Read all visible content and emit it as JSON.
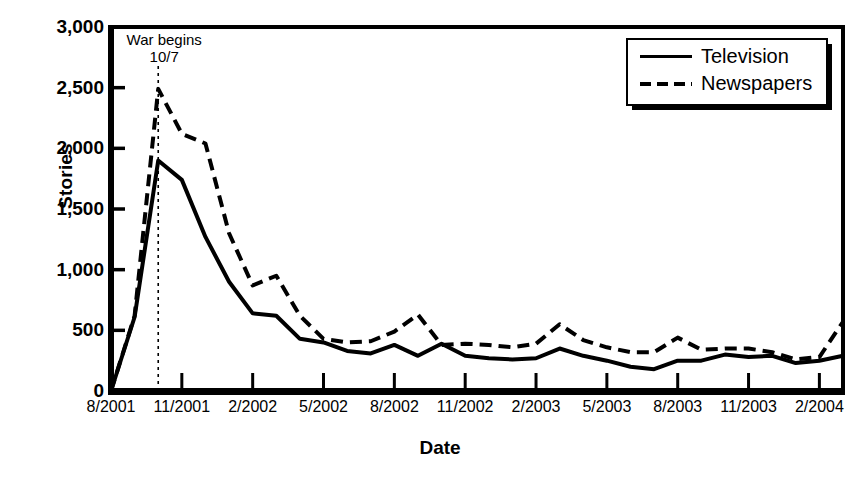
{
  "chart_data": {
    "type": "line",
    "title": "",
    "xlabel": "Date",
    "ylabel": "Stories",
    "ylim": [
      0,
      3000
    ],
    "ytick_values": [
      0,
      500,
      1000,
      1500,
      2000,
      2500,
      3000
    ],
    "ytick_labels": [
      "0",
      "500",
      "1,000",
      "1,500",
      "2,000",
      "2,500",
      "3,000"
    ],
    "xtick_labels": [
      "8/2001",
      "11/2001",
      "2/2002",
      "5/2002",
      "8/2002",
      "11/2002",
      "2/2003",
      "5/2003",
      "8/2003",
      "11/2003",
      "2/2004"
    ],
    "grid": false,
    "legend_position": "top-right",
    "x": [
      "8/2001",
      "9/2001",
      "10/2001",
      "11/2001",
      "12/2001",
      "1/2002",
      "2/2002",
      "3/2002",
      "4/2002",
      "5/2002",
      "6/2002",
      "7/2002",
      "8/2002",
      "9/2002",
      "10/2002",
      "11/2002",
      "12/2002",
      "1/2003",
      "2/2003",
      "3/2003",
      "4/2003",
      "5/2003",
      "6/2003",
      "7/2003",
      "8/2003",
      "9/2003",
      "10/2003",
      "11/2003",
      "12/2003",
      "1/2004",
      "2/2004",
      "3/2004"
    ],
    "series": [
      {
        "name": "Television",
        "style": "solid",
        "values": [
          0,
          610,
          1900,
          1740,
          1270,
          900,
          640,
          620,
          430,
          400,
          330,
          310,
          380,
          290,
          390,
          290,
          270,
          260,
          270,
          350,
          290,
          250,
          200,
          180,
          250,
          250,
          300,
          280,
          290,
          230,
          250,
          290
        ]
      },
      {
        "name": "Newspapers",
        "style": "dashed",
        "values": [
          0,
          620,
          2490,
          2120,
          2040,
          1300,
          870,
          950,
          620,
          430,
          400,
          410,
          490,
          630,
          380,
          390,
          380,
          360,
          390,
          550,
          420,
          360,
          320,
          320,
          440,
          340,
          350,
          350,
          320,
          260,
          280,
          570
        ]
      }
    ],
    "annotations": [
      {
        "name": "war-begins",
        "line1": "War begins",
        "line2": "10/7",
        "x": "10/2001"
      }
    ]
  },
  "legend": {
    "items": [
      {
        "label": "Television",
        "style": "solid"
      },
      {
        "label": "Newspapers",
        "style": "dashed"
      }
    ]
  }
}
